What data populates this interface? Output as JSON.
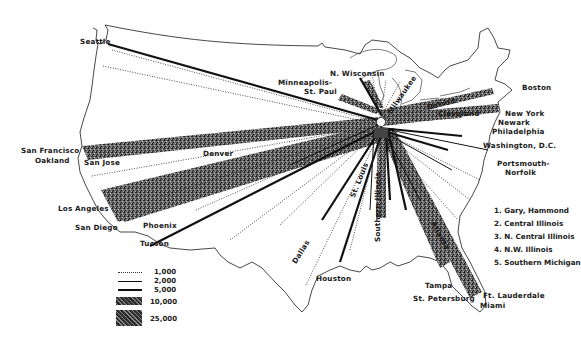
{
  "map": {
    "hub": "Chicago",
    "cities": {
      "seattle": "Seattle",
      "n_wisconsin": "N. Wisconsin",
      "minneapolis": "Minneapolis-",
      "st_paul": "St. Paul",
      "milwaukee": "Milwaukee",
      "detroit": "Detroit",
      "boston": "Boston",
      "cleveland": "Cleveland",
      "new_york": "New York",
      "newark": "Newark",
      "philadelphia": "Philadelphia",
      "washington": "Washington, D.C.",
      "portsmouth": "Portsmouth-",
      "norfolk": "Norfolk",
      "san_francisco": "San Francisco",
      "oakland": "Oakland",
      "san_jose": "San Jose",
      "denver": "Denver",
      "los_angeles": "Los Angeles",
      "san_diego": "San Diego",
      "phoenix": "Phoenix",
      "tucson": "Tucson",
      "dallas": "Dallas",
      "st_louis": "St. Louis",
      "southern_illinois": "Southern Illinois",
      "atlanta": "Atlanta",
      "houston": "Houston",
      "tampa": "Tampa",
      "st_petersburg": "St. Petersburg",
      "ft_lauderdale": "Ft. Lauderdale",
      "miami": "Miami"
    },
    "hub_numbers": [
      "1",
      "2",
      "3",
      "4",
      "5"
    ]
  },
  "legend": {
    "items": [
      {
        "label": "1,000",
        "style": "dotted"
      },
      {
        "label": "2,000",
        "style": "thin-line"
      },
      {
        "label": "5,000",
        "style": "thick-line"
      },
      {
        "label": "10,000",
        "style": "textured-band"
      },
      {
        "label": "25,000",
        "style": "wide-textured-band"
      }
    ]
  },
  "notes": {
    "items": [
      "1. Gary, Hammond",
      "2. Central Illinois",
      "3. N. Central Illinois",
      "4. N.W. Illinois",
      "5. Southern Michigan"
    ]
  }
}
